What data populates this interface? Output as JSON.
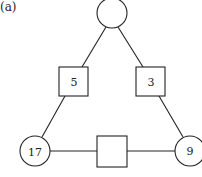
{
  "figure": {
    "label": "(a)",
    "nodes": {
      "circle_top": {
        "shape": "circle",
        "value": ""
      },
      "circle_left": {
        "shape": "circle",
        "value": "17"
      },
      "circle_right": {
        "shape": "circle",
        "value": "9"
      },
      "square_left": {
        "shape": "square",
        "value": "5"
      },
      "square_right": {
        "shape": "square",
        "value": "3"
      },
      "square_bottom": {
        "shape": "square",
        "value": ""
      }
    },
    "edges": [
      [
        "circle_top",
        "square_left"
      ],
      [
        "square_left",
        "circle_left"
      ],
      [
        "circle_top",
        "square_right"
      ],
      [
        "square_right",
        "circle_right"
      ],
      [
        "circle_left",
        "square_bottom"
      ],
      [
        "square_bottom",
        "circle_right"
      ]
    ],
    "colors": {
      "stroke": "#222222",
      "fill": "#ffffff"
    }
  }
}
